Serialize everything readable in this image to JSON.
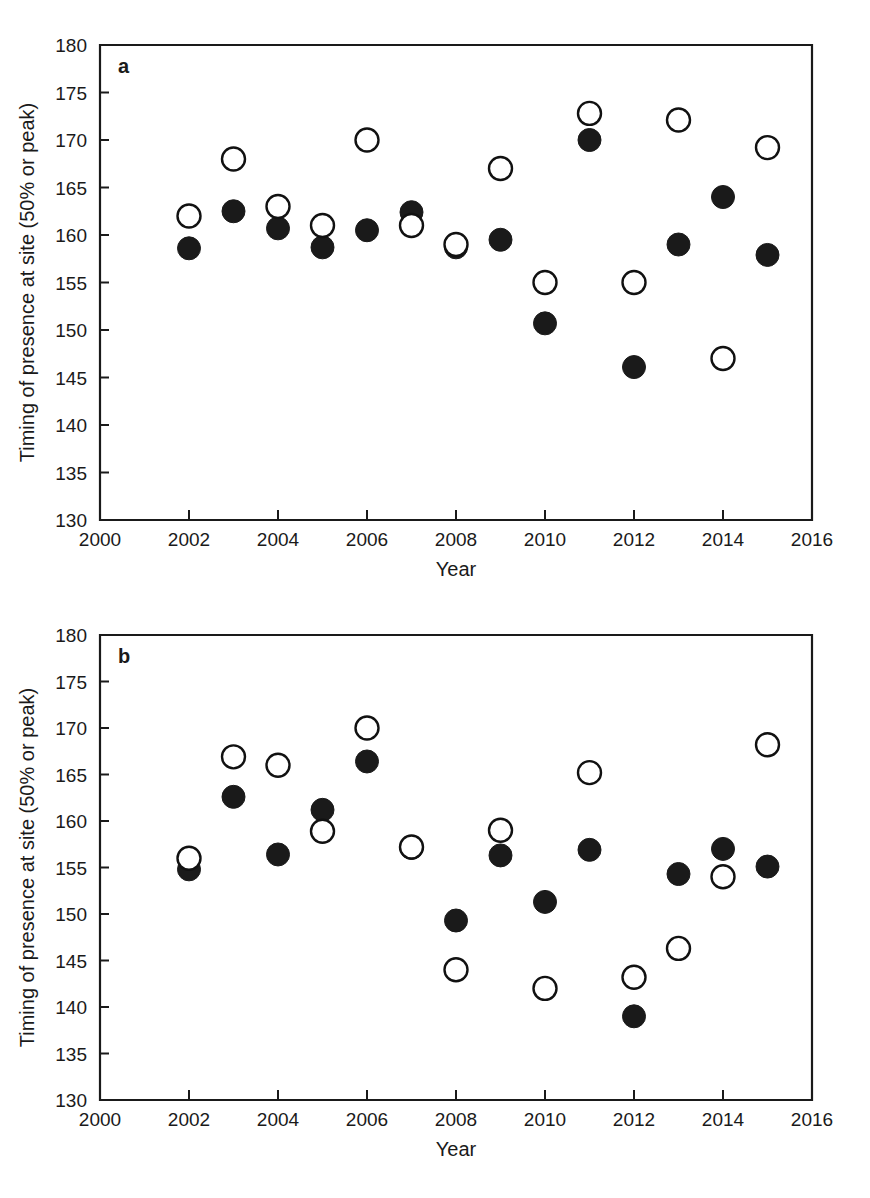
{
  "figure": {
    "panels": [
      {
        "letter": "a",
        "xlabel": "Year",
        "ylabel": "Timing of presence at site (50% or peak)",
        "xlim": [
          2000,
          2016
        ],
        "ylim": [
          130,
          180
        ],
        "xticks": [
          2000,
          2002,
          2004,
          2006,
          2008,
          2010,
          2012,
          2014,
          2016
        ],
        "xticklabels": [
          "2000",
          "2002",
          "2004",
          "2006",
          "2008",
          "2010",
          "2012",
          "2014",
          "2016"
        ],
        "yticks": [
          130,
          135,
          140,
          145,
          150,
          155,
          160,
          165,
          170,
          175,
          180
        ],
        "yticklabels": [
          "130",
          "135",
          "140",
          "145",
          "150",
          "155",
          "160",
          "165",
          "170",
          "175",
          "180"
        ]
      },
      {
        "letter": "b",
        "xlabel": "Year",
        "ylabel": "Timing of presence at site (50% or peak)",
        "xlim": [
          2000,
          2016
        ],
        "ylim": [
          130,
          180
        ],
        "xticks": [
          2000,
          2002,
          2004,
          2006,
          2008,
          2010,
          2012,
          2014,
          2016
        ],
        "xticklabels": [
          "2000",
          "2002",
          "2004",
          "2006",
          "2008",
          "2010",
          "2012",
          "2014",
          "2016"
        ],
        "yticks": [
          130,
          135,
          140,
          145,
          150,
          155,
          160,
          165,
          170,
          175,
          180
        ],
        "yticklabels": [
          "130",
          "135",
          "140",
          "145",
          "150",
          "155",
          "160",
          "165",
          "170",
          "175",
          "180"
        ]
      }
    ]
  },
  "chart_data": [
    {
      "type": "scatter",
      "title": "a",
      "xlabel": "Year",
      "ylabel": "Timing of presence at site (50% or peak)",
      "xlim": [
        2000,
        2016
      ],
      "ylim": [
        130,
        180
      ],
      "xticks": [
        2000,
        2002,
        2004,
        2006,
        2008,
        2010,
        2012,
        2014,
        2016
      ],
      "yticks": [
        130,
        135,
        140,
        145,
        150,
        155,
        160,
        165,
        170,
        175,
        180
      ],
      "grid": false,
      "legend": false,
      "x": [
        2002,
        2003,
        2004,
        2005,
        2006,
        2007,
        2008,
        2009,
        2010,
        2011,
        2012,
        2013,
        2014,
        2015
      ],
      "series": [
        {
          "name": "open-circle",
          "marker": "open circle",
          "values": [
            162.0,
            168.0,
            163.0,
            161.0,
            170.0,
            161.0,
            159.0,
            167.0,
            155.0,
            172.8,
            155.0,
            172.1,
            147.0,
            169.2
          ]
        },
        {
          "name": "filled-circle",
          "marker": "filled circle",
          "values": [
            158.6,
            162.5,
            160.7,
            158.7,
            160.5,
            162.4,
            158.7,
            159.5,
            150.7,
            170.0,
            146.1,
            159.0,
            164.0,
            157.9
          ]
        }
      ]
    },
    {
      "type": "scatter",
      "title": "b",
      "xlabel": "Year",
      "ylabel": "Timing of presence at site (50% or peak)",
      "xlim": [
        2000,
        2016
      ],
      "ylim": [
        130,
        180
      ],
      "xticks": [
        2000,
        2002,
        2004,
        2006,
        2008,
        2010,
        2012,
        2014,
        2016
      ],
      "yticks": [
        130,
        135,
        140,
        145,
        150,
        155,
        160,
        165,
        170,
        175,
        180
      ],
      "grid": false,
      "legend": false,
      "x": [
        2002,
        2003,
        2004,
        2005,
        2006,
        2007,
        2008,
        2009,
        2010,
        2011,
        2012,
        2013,
        2014,
        2015
      ],
      "series": [
        {
          "name": "open-circle",
          "marker": "open circle",
          "values": [
            156.0,
            166.9,
            166.0,
            158.9,
            170.0,
            157.2,
            144.0,
            159.0,
            142.0,
            165.2,
            143.2,
            146.3,
            154.0,
            168.2
          ]
        },
        {
          "name": "filled-circle",
          "marker": "filled circle",
          "values": [
            154.8,
            162.6,
            156.4,
            161.2,
            166.4,
            157.1,
            149.3,
            156.3,
            151.3,
            156.9,
            139.0,
            154.3,
            157.0,
            155.1
          ]
        }
      ]
    }
  ],
  "colors": {
    "axis": "#1a1a1a",
    "filled_marker": "#1a1a1a",
    "open_marker_stroke": "#111111",
    "open_marker_fill": "#ffffff",
    "background": "#ffffff"
  }
}
